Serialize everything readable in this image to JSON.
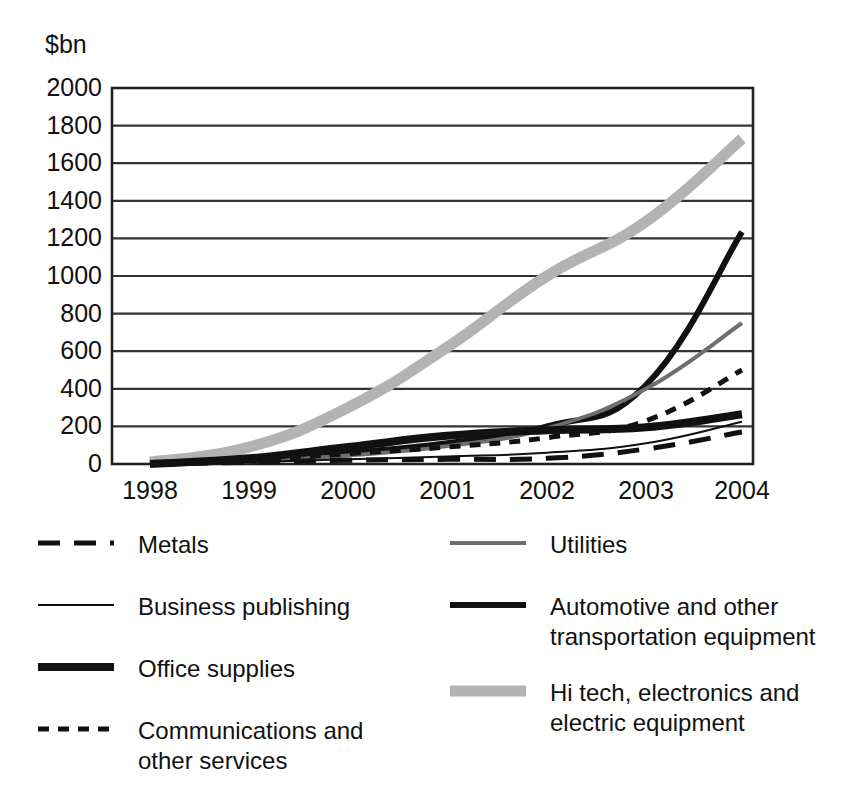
{
  "chart_data": {
    "type": "line",
    "title": "",
    "subtitle": "",
    "xlabel": "",
    "ylabel": "$bn",
    "unit_caption": "$bn",
    "grid": true,
    "legend_position": "bottom",
    "x": [
      1998,
      1999,
      2000,
      2001,
      2002,
      2003,
      2004
    ],
    "xtick_labels": [
      "1998",
      "1999",
      "2000",
      "2001",
      "2002",
      "2003",
      "2004"
    ],
    "ytick_labels": [
      "2000",
      "1800",
      "1600",
      "1400",
      "1200",
      "1000",
      "800",
      "600",
      "400",
      "200",
      "0"
    ],
    "ytick_values": [
      2000,
      1800,
      1600,
      1400,
      1200,
      1000,
      800,
      600,
      400,
      200,
      0
    ],
    "ylim": [
      0,
      2000
    ],
    "xlim": [
      1998,
      2004
    ],
    "series": [
      {
        "name": "Metals",
        "style": "long-dash",
        "color": "#111111",
        "width": 5,
        "dash": "22,14",
        "values": [
          0,
          10,
          20,
          25,
          30,
          80,
          170
        ]
      },
      {
        "name": "Business publishing",
        "style": "thin-solid",
        "color": "#111111",
        "width": 2,
        "dash": "",
        "values": [
          0,
          10,
          25,
          40,
          60,
          110,
          225
        ]
      },
      {
        "name": "Office supplies",
        "style": "thick-solid",
        "color": "#111111",
        "width": 8,
        "dash": "",
        "values": [
          0,
          30,
          90,
          150,
          180,
          195,
          265
        ]
      },
      {
        "name": "Communications and\nother services",
        "style": "short-dash",
        "color": "#111111",
        "width": 5,
        "dash": "11,9",
        "values": [
          0,
          20,
          55,
          90,
          140,
          230,
          500
        ]
      },
      {
        "name": "Utilities",
        "style": "medium-gray-thin",
        "color": "#6e6e6e",
        "width": 4,
        "dash": "",
        "values": [
          0,
          15,
          45,
          95,
          190,
          400,
          750
        ]
      },
      {
        "name": "Automotive and other\ntransportation equipment",
        "style": "medium-black",
        "color": "#111111",
        "width": 6,
        "dash": "",
        "values": [
          0,
          20,
          60,
          110,
          200,
          420,
          1235
        ]
      },
      {
        "name": "Hi tech, electronics and\nelectric equipment",
        "style": "thick-light-gray",
        "color": "#b3b3b3",
        "width": 11,
        "dash": "",
        "values": [
          10,
          90,
          300,
          620,
          1000,
          1290,
          1730
        ]
      }
    ]
  },
  "axis": {
    "y_unit": "$bn"
  },
  "legend": {
    "left_column": [
      {
        "label": "Metals",
        "series_index": 0
      },
      {
        "label": "Business publishing",
        "series_index": 1
      },
      {
        "label": "Office supplies",
        "series_index": 2
      },
      {
        "label": "Communications and\nother services",
        "series_index": 3
      }
    ],
    "right_column": [
      {
        "label": "Utilities",
        "series_index": 4
      },
      {
        "label": "Automotive and other\ntransportation equipment",
        "series_index": 5
      },
      {
        "label": "Hi tech, electronics and\nelectric equipment",
        "series_index": 6
      }
    ]
  },
  "colors": {
    "background": "#ffffff",
    "frame": "#222222",
    "gridline": "#333333",
    "text": "#111111",
    "gray_mid": "#6e6e6e",
    "gray_light": "#b3b3b3"
  }
}
